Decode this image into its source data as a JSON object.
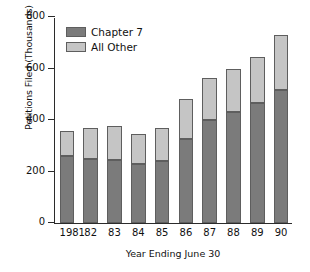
{
  "chart_data": {
    "type": "bar",
    "stacked": true,
    "title": "",
    "xlabel": "Year Ending June 30",
    "ylabel": "Petitions Filed (Thousands)",
    "categories": [
      "1981",
      "82",
      "83",
      "84",
      "85",
      "86",
      "87",
      "88",
      "89",
      "90"
    ],
    "series": [
      {
        "name": "Chapter 7",
        "color": "#7b7b7b",
        "values": [
          260,
          250,
          245,
          228,
          240,
          325,
          400,
          430,
          465,
          518
        ]
      },
      {
        "name": "All Other",
        "color": "#c5c5c5",
        "values": [
          97,
          118,
          130,
          117,
          130,
          158,
          163,
          170,
          180,
          212
        ]
      }
    ],
    "totals": [
      357,
      368,
      375,
      345,
      370,
      483,
      563,
      600,
      645,
      730
    ],
    "ylim": [
      0,
      800
    ],
    "yticks": [
      0,
      200,
      400,
      600,
      800
    ],
    "ytick_labels": [
      "0",
      "200",
      "400",
      "600",
      "800"
    ],
    "grid": false,
    "legend_position": "upper-left-inside"
  },
  "legend": {
    "items": [
      {
        "label": "Chapter 7",
        "color": "#7b7b7b"
      },
      {
        "label": "All Other",
        "color": "#c5c5c5"
      }
    ]
  },
  "axes": {
    "y_title": "Petitions Filed (Thousands)",
    "x_title": "Year Ending June 30"
  },
  "colors": {
    "chapter7": "#7b7b7b",
    "all_other": "#c5c5c5",
    "bar_outline": "#5e5e5e",
    "axis": "#2b2b2b",
    "text": "#111111",
    "background": "#ffffff"
  }
}
